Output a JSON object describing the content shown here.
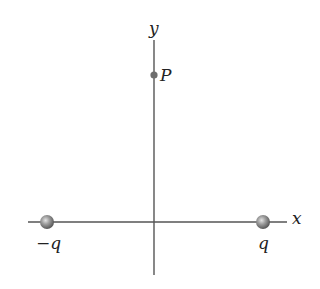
{
  "diagram": {
    "axes": {
      "x_label": "x",
      "y_label": "y"
    },
    "point": {
      "label": "P"
    },
    "charges": [
      {
        "label": "−q",
        "position": "left"
      },
      {
        "label": "q",
        "position": "right"
      }
    ],
    "colors": {
      "axis": "#555555",
      "charge": "#8a8a8a",
      "point": "#6e6e6e"
    }
  }
}
